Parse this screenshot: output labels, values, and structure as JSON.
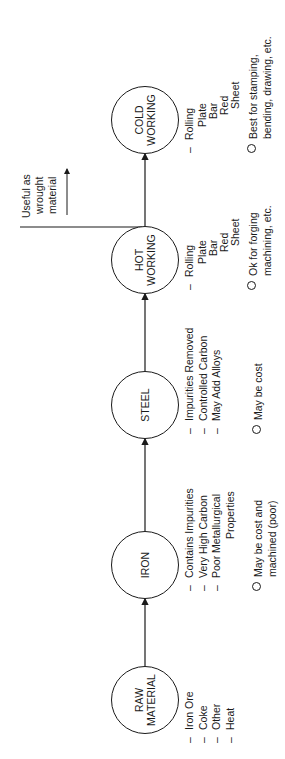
{
  "diagram": {
    "orientation": "rotated-90-ccw",
    "nodes": [
      {
        "id": "raw",
        "label_lines": [
          "RAW",
          "MATERIAL"
        ]
      },
      {
        "id": "iron",
        "label_lines": [
          "IRON"
        ]
      },
      {
        "id": "steel",
        "label_lines": [
          "STEEL"
        ]
      },
      {
        "id": "hot",
        "label_lines": [
          "HOT",
          "WORKING"
        ]
      },
      {
        "id": "cold",
        "label_lines": [
          "COLD",
          "WORKING"
        ]
      }
    ],
    "edges": [
      {
        "from": "raw",
        "to": "iron"
      },
      {
        "from": "iron",
        "to": "steel"
      },
      {
        "from": "steel",
        "to": "hot"
      },
      {
        "from": "hot",
        "to": "cold"
      }
    ],
    "raw": {
      "items": [
        "Iron Ore",
        "Coke",
        "Other",
        "Heat"
      ]
    },
    "iron": {
      "items": [
        "Contains Impurities",
        "Very High Carbon",
        "Poor Metallurgical"
      ],
      "items_cont": "Properties",
      "note_lines": [
        "May be cost and",
        "machined (poor)"
      ]
    },
    "steel": {
      "items": [
        "Impurities Removed",
        "Controlled Carbon",
        "May Add Alloys"
      ],
      "note_lines": [
        "May be cost"
      ]
    },
    "hot": {
      "head": "Rolling",
      "sub": [
        "Plate",
        "Bar",
        "Red",
        "Sheet"
      ],
      "note_lines": [
        "Ok for forging",
        "machining, etc."
      ]
    },
    "cold": {
      "head": "Rolling",
      "sub": [
        "Plate",
        "Bar",
        "Red",
        "Sheet"
      ],
      "note_lines": [
        "Best for stamping,",
        "bending, drawing, etc."
      ]
    },
    "annotation": {
      "lines": [
        "Useful as",
        "wrought",
        "material"
      ]
    },
    "markers": {
      "dash": "–"
    }
  }
}
